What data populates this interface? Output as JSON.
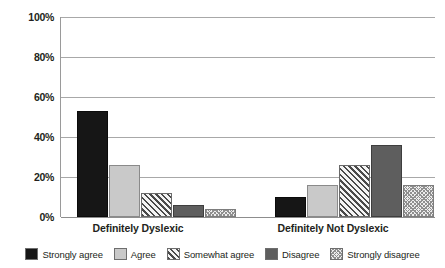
{
  "chart_data": {
    "type": "bar",
    "title": "",
    "xlabel": "",
    "ylabel": "",
    "ylim": [
      0,
      100
    ],
    "y_tick_labels": [
      "100%",
      "80%",
      "60%",
      "40%",
      "20%",
      "0%"
    ],
    "y_ticks": [
      100,
      80,
      60,
      40,
      20,
      0
    ],
    "grid": true,
    "legend_position": "bottom",
    "categories": [
      "Definitely Dyslexic",
      "Definitely Not Dyslexic"
    ],
    "series": [
      {
        "name": "Strongly agree",
        "values": [
          53,
          10
        ],
        "fill": "solid-dark",
        "color": "#161616"
      },
      {
        "name": "Agree",
        "values": [
          26,
          16
        ],
        "fill": "solid-light",
        "color": "#c9c9c9"
      },
      {
        "name": "Somewhat agree",
        "values": [
          12,
          26
        ],
        "fill": "hatch",
        "color": "#4a4a4a"
      },
      {
        "name": "Disagree",
        "values": [
          6,
          36
        ],
        "fill": "solid-mid",
        "color": "#5e5e5e"
      },
      {
        "name": "Strongly disagree",
        "values": [
          4,
          16
        ],
        "fill": "checker",
        "color": "#8f8f8f"
      }
    ]
  },
  "axis": {
    "gridline_color": "#a8a8a8",
    "axis_color": "#8d8d8d"
  }
}
